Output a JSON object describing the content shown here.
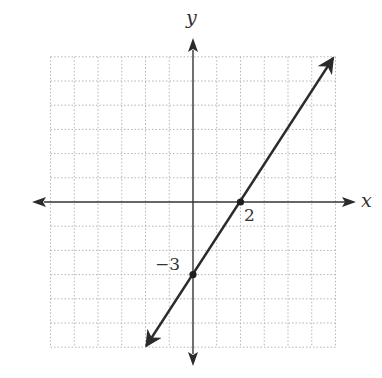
{
  "chart_data": {
    "type": "line",
    "title": "",
    "xlabel": "x",
    "ylabel": "y",
    "xlim": [
      -6,
      6
    ],
    "ylim": [
      -6,
      6
    ],
    "grid": true,
    "grid_style": "dotted",
    "line_equation": "y = 1.5x - 3",
    "series": [
      {
        "name": "line",
        "x": [
          -1.97,
          5.9
        ],
        "y": [
          -5.95,
          5.95
        ],
        "arrows_both_ends": true
      }
    ],
    "points": [
      {
        "x": 0,
        "y": -3,
        "label": "−3"
      },
      {
        "x": 2,
        "y": 0,
        "label": "2"
      }
    ]
  },
  "labels": {
    "x_axis": "x",
    "y_axis": "y",
    "y_intercept": "−3",
    "x_intercept": "2"
  },
  "colors": {
    "axis": "#333333",
    "line": "#2b2b2b",
    "grid": "#b5b5b5"
  }
}
